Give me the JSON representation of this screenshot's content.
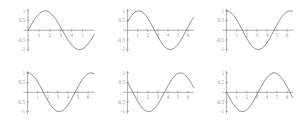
{
  "figure": {
    "title": "",
    "background_color": "#ffffff",
    "curve_color": "#6e6e6e",
    "axis_color": "#8d8d8d",
    "label_color": "#9a9a9a",
    "rows": 2,
    "columns": 3,
    "panel_count": 6
  },
  "axes": {
    "y_tick_labels": [
      "1",
      "0.5",
      "-0.5",
      "-1"
    ],
    "y_tick_values": [
      1,
      0.5,
      -0.5,
      -1
    ],
    "x_tick_labels": [
      "1",
      "2",
      "3",
      "4",
      "5",
      "6"
    ],
    "x_tick_values": [
      1,
      2,
      3,
      4,
      5,
      6
    ],
    "ylim": [
      -1.15,
      1.15
    ],
    "xlim": [
      -0.55,
      6.65
    ],
    "grid": false,
    "legend": "none"
  },
  "chart_data": [
    {
      "type": "line",
      "title": "",
      "xlabel": "",
      "ylabel": "",
      "panel": 1,
      "row": 1,
      "column": 1,
      "description": "sine wave starting at zero, rising",
      "phase": 0.0,
      "amplitude": 1,
      "xlim": [
        -0.55,
        6.1
      ],
      "ylim": [
        -1.15,
        1.15
      ],
      "x_tick_labels": [
        "1",
        "2",
        "3",
        "4",
        "5"
      ],
      "y_tick_labels": [
        "1",
        "0.5",
        "-0.5",
        "-1"
      ],
      "x": [
        0,
        0.4,
        0.8,
        1.2,
        1.6,
        2.0,
        2.4,
        2.8,
        3.2,
        3.6,
        4.0,
        4.4,
        4.8,
        5.2,
        5.6,
        6.0
      ],
      "values": [
        0,
        0.389,
        0.717,
        0.932,
        1.0,
        0.909,
        0.675,
        0.335,
        -0.058,
        -0.443,
        -0.757,
        -0.952,
        -0.996,
        -0.883,
        -0.631,
        -0.279
      ]
    },
    {
      "type": "line",
      "title": "",
      "xlabel": "",
      "ylabel": "",
      "panel": 2,
      "row": 1,
      "column": 2,
      "description": "phase shifted sine, starts near 0.45 rising",
      "phase": 0.47,
      "amplitude": 1,
      "xlim": [
        -0.55,
        6.65
      ],
      "ylim": [
        -1.15,
        1.15
      ],
      "x_tick_labels": [
        "1",
        "2",
        "3",
        "4",
        "5",
        "6"
      ],
      "y_tick_labels": [
        "1",
        "0.5",
        "-0.5",
        "-1"
      ],
      "x": [
        0,
        0.4,
        0.8,
        1.2,
        1.6,
        2.0,
        2.4,
        2.8,
        3.2,
        3.6,
        4.0,
        4.4,
        4.8,
        5.2,
        5.6,
        6.0,
        6.3
      ],
      "values": [
        0.453,
        0.761,
        0.955,
        0.999,
        0.885,
        0.633,
        0.281,
        -0.108,
        -0.484,
        -0.784,
        -0.964,
        -0.994,
        -0.868,
        -0.606,
        -0.246,
        0.145,
        0.414
      ]
    },
    {
      "type": "line",
      "title": "",
      "xlabel": "",
      "ylabel": "",
      "panel": 3,
      "row": 1,
      "column": 3,
      "description": "cosine wave starting at one",
      "phase": 1.5708,
      "amplitude": 1,
      "xlim": [
        -0.55,
        6.65
      ],
      "ylim": [
        -1.15,
        1.15
      ],
      "x_tick_labels": [
        "1",
        "2",
        "3",
        "4",
        "5",
        "6"
      ],
      "y_tick_labels": [
        "1",
        "0.5",
        "-0.5",
        "-1"
      ],
      "x": [
        0,
        0.4,
        0.8,
        1.2,
        1.6,
        2.0,
        2.4,
        2.8,
        3.2,
        3.6,
        4.0,
        4.4,
        4.8,
        5.2,
        5.6,
        6.0,
        6.3
      ],
      "values": [
        1.0,
        0.921,
        0.697,
        0.362,
        -0.029,
        -0.416,
        -0.737,
        -0.942,
        -0.998,
        -0.897,
        -0.654,
        -0.307,
        0.087,
        0.469,
        0.775,
        0.96,
        1.0
      ]
    },
    {
      "type": "line",
      "title": "",
      "xlabel": "",
      "ylabel": "",
      "panel": 4,
      "row": 2,
      "column": 1,
      "description": "cosine wave starting at one",
      "phase": 1.5708,
      "amplitude": 1,
      "xlim": [
        -0.55,
        6.65
      ],
      "ylim": [
        -1.15,
        1.15
      ],
      "x_tick_labels": [
        "1",
        "2",
        "3",
        "4",
        "5",
        "6"
      ],
      "y_tick_labels": [
        "1",
        "0.5",
        "-0.5",
        "-1"
      ],
      "x": [
        0,
        0.4,
        0.8,
        1.2,
        1.6,
        2.0,
        2.4,
        2.8,
        3.2,
        3.6,
        4.0,
        4.4,
        4.8,
        5.2,
        5.6,
        6.0,
        6.3
      ],
      "values": [
        1.0,
        0.921,
        0.697,
        0.362,
        -0.029,
        -0.416,
        -0.737,
        -0.942,
        -0.998,
        -0.897,
        -0.654,
        -0.307,
        0.087,
        0.469,
        0.775,
        0.96,
        1.0
      ]
    },
    {
      "type": "line",
      "title": "",
      "xlabel": "",
      "ylabel": "",
      "panel": 5,
      "row": 2,
      "column": 2,
      "description": "phase shifted sine starting near 0.5 and falling",
      "phase": 2.62,
      "amplitude": 1,
      "xlim": [
        -0.55,
        6.65
      ],
      "ylim": [
        -1.15,
        1.15
      ],
      "x_tick_labels": [
        "1",
        "2",
        "3",
        "4",
        "5",
        "6"
      ],
      "y_tick_labels": [
        "1",
        "0.5",
        "-0.5",
        "-1"
      ],
      "x": [
        0,
        0.4,
        0.8,
        1.2,
        1.6,
        2.0,
        2.4,
        2.8,
        3.2,
        3.6,
        4.0,
        4.4,
        4.8,
        5.2,
        5.6,
        6.0,
        6.3
      ],
      "values": [
        0.497,
        0.151,
        -0.24,
        -0.58,
        -0.835,
        -0.98,
        -0.999,
        -0.891,
        -0.67,
        -0.359,
        0.025,
        0.412,
        0.734,
        0.941,
        0.998,
        0.898,
        0.777
      ]
    },
    {
      "type": "line",
      "title": "",
      "xlabel": "",
      "ylabel": "",
      "panel": 6,
      "row": 2,
      "column": 3,
      "description": "negative sine wave, starts at zero falling",
      "phase": 3.1416,
      "amplitude": 1,
      "xlim": [
        -0.55,
        6.65
      ],
      "ylim": [
        -1.15,
        1.15
      ],
      "x_tick_labels": [
        "1",
        "2",
        "3",
        "4",
        "5",
        "6"
      ],
      "y_tick_labels": [
        "1",
        "0.5",
        "-0.5",
        "-1"
      ],
      "x": [
        0,
        0.4,
        0.8,
        1.2,
        1.6,
        2.0,
        2.4,
        2.8,
        3.2,
        3.6,
        4.0,
        4.4,
        4.8,
        5.2,
        5.6,
        6.0,
        6.3
      ],
      "values": [
        0,
        -0.389,
        -0.717,
        -0.932,
        -1.0,
        -0.909,
        -0.675,
        -0.335,
        0.058,
        0.443,
        0.757,
        0.952,
        0.996,
        0.883,
        0.631,
        0.279,
        -0.017
      ]
    }
  ]
}
